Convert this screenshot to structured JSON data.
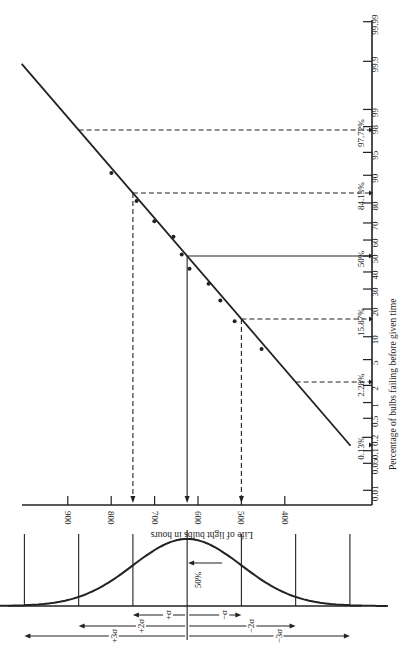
{
  "chart_data": {
    "type": "scatter",
    "title": "",
    "orientation": "rotated-90-clockwise",
    "xlabel": "Life of light bulbs in hours",
    "ylabel": "Percentage of bulbs failing before given time",
    "x_axis": {
      "label": "Life of light bulbs in hours",
      "ticks": [
        900,
        800,
        700,
        600,
        500,
        400
      ]
    },
    "y_axis": {
      "label": "Percentage of bulbs failing before given time",
      "scale": "normal-probability",
      "ticks": [
        "0.01",
        "0.05",
        "0.1",
        "0.2",
        "0.5",
        "1",
        "2",
        "5",
        "10",
        "20",
        "30",
        "40",
        "50",
        "60",
        "70",
        "80",
        "90",
        "95",
        "98",
        "99",
        "99.9",
        "99.99"
      ],
      "tick_values": [
        0.01,
        0.05,
        0.1,
        0.2,
        0.5,
        1,
        2,
        5,
        10,
        20,
        30,
        40,
        50,
        60,
        70,
        80,
        90,
        95,
        98,
        99,
        99.9,
        99.99
      ]
    },
    "series": [
      {
        "name": "Observed failures",
        "points": [
          {
            "hours": 803,
            "percent": 90.6
          },
          {
            "hours": 745,
            "percent": 80.9
          },
          {
            "hours": 704,
            "percent": 71
          },
          {
            "hours": 660,
            "percent": 62
          },
          {
            "hours": 641,
            "percent": 51
          },
          {
            "hours": 623,
            "percent": 42
          },
          {
            "hours": 579,
            "percent": 33
          },
          {
            "hours": 552,
            "percent": 24
          },
          {
            "hours": 519,
            "percent": 15
          },
          {
            "hours": 457,
            "percent": 7
          }
        ]
      }
    ],
    "fit_line": {
      "mean_hours": 625,
      "sigma_hours": 125,
      "percent_range": [
        0.13,
        99.99
      ]
    },
    "reference_lines": [
      {
        "label": "97.72%",
        "percent": 97.72,
        "z": 2,
        "style": "dashed",
        "drop_to_axis": false
      },
      {
        "label": "84.13%",
        "percent": 84.13,
        "z": 1,
        "style": "dashed",
        "drop_to_axis": true
      },
      {
        "label": "50%",
        "percent": 50,
        "z": 0,
        "style": "solid",
        "drop_to_axis": true
      },
      {
        "label": "15.87%",
        "percent": 15.87,
        "z": -1,
        "style": "dashed",
        "drop_to_axis": true
      },
      {
        "label": "2.28%",
        "percent": 2.28,
        "z": -2,
        "style": "dashed",
        "drop_to_axis": false
      },
      {
        "label": "0.13%",
        "percent": 0.13,
        "z": -3,
        "style": "none",
        "drop_to_axis": false
      }
    ],
    "normal_curve": {
      "mean_hours": 625,
      "sigma_hours": 125,
      "center_label": "50%",
      "sigma_labels": [
        "+σ",
        "−σ",
        "+2σ",
        "−2σ",
        "+3σ",
        "−3σ"
      ]
    }
  }
}
